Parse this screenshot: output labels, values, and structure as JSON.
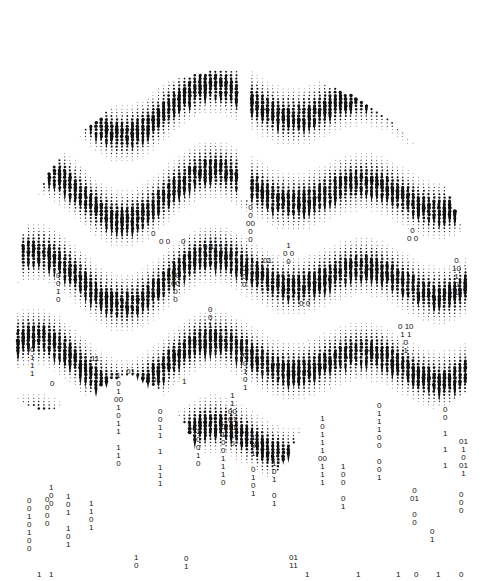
{
  "artwork": {
    "subject": "brain",
    "style": "halftone dot-and-droplet pattern dissolving into binary digits",
    "colors": {
      "ink": "#111111",
      "background": "#ffffff"
    },
    "brain_center": [
      243,
      260
    ],
    "brain_radius": [
      225,
      215
    ]
  },
  "binary_columns": [
    {
      "x": 31,
      "y": 545,
      "text": "0\n0\n1\n0\n1\n0\n0"
    },
    {
      "x": 41,
      "y": 571,
      "text": "1"
    },
    {
      "x": 53,
      "y": 500,
      "text": "1\n0\n0"
    },
    {
      "x": 49,
      "y": 520,
      "text": "0\n0\n0\n0"
    },
    {
      "x": 53,
      "y": 571,
      "text": "1"
    },
    {
      "x": 70,
      "y": 541,
      "text": "1\n0\n1\n\n1\n0\n1"
    },
    {
      "x": 93,
      "y": 524,
      "text": "1\n1\n0\n1"
    },
    {
      "x": 118,
      "y": 460,
      "text": "1\n0\n1\n00\n1\n0\n1\n1\n\n1\n1\n0"
    },
    {
      "x": 138,
      "y": 562,
      "text": "1\n0"
    },
    {
      "x": 162,
      "y": 480,
      "text": "0\n0\n1\n1\n\n1\n\n1\n1\n1"
    },
    {
      "x": 188,
      "y": 563,
      "text": "0\n1"
    },
    {
      "x": 200,
      "y": 460,
      "text": "1\n0\n0\n1\n0"
    },
    {
      "x": 225,
      "y": 479,
      "text": "0\n1\n0\n0\n1\n1\n1\n0"
    },
    {
      "x": 232,
      "y": 440,
      "text": "1\n1\n00\n01\n11\n1\n0"
    },
    {
      "x": 255,
      "y": 490,
      "text": "1\n0\n1\n\n0\n1\n0\n1"
    },
    {
      "x": 276,
      "y": 500,
      "text": "1\n0\n1\n\n0\n1"
    },
    {
      "x": 322,
      "y": 479,
      "text": "1\n0\n1\n1\n1\n00\n1\n1\n1"
    },
    {
      "x": 345,
      "y": 503,
      "text": "1\n0\n0\n\n0\n1"
    },
    {
      "x": 381,
      "y": 474,
      "text": "0\n1\n1\n1\n0\n0\n\n0\n0\n1"
    },
    {
      "x": 414,
      "y": 519,
      "text": "0\n01\n\n0\n0"
    },
    {
      "x": 447,
      "y": 462,
      "text": "0\n0\n\n1\n\n1\n\n1"
    },
    {
      "x": 463,
      "y": 470,
      "text": "01\n1\n0\n01\n1"
    },
    {
      "x": 463,
      "y": 507,
      "text": "0\n0\n0"
    },
    {
      "x": 434,
      "y": 536,
      "text": "0\n1"
    },
    {
      "x": 440,
      "y": 571,
      "text": "1"
    },
    {
      "x": 463,
      "y": 571,
      "text": "0"
    },
    {
      "x": 293,
      "y": 562,
      "text": "01\n11"
    },
    {
      "x": 309,
      "y": 571,
      "text": "1"
    },
    {
      "x": 360,
      "y": 571,
      "text": "1"
    },
    {
      "x": 400,
      "y": 571,
      "text": "1"
    },
    {
      "x": 418,
      "y": 571,
      "text": "0"
    }
  ],
  "inner_digits": [
    {
      "x": 155,
      "y": 230,
      "text": "0"
    },
    {
      "x": 163,
      "y": 238,
      "text": "0 0"
    },
    {
      "x": 185,
      "y": 238,
      "text": "0"
    },
    {
      "x": 207,
      "y": 243,
      "text": "0 1"
    },
    {
      "x": 250,
      "y": 236,
      "text": "0\n0\n00\n0\n0"
    },
    {
      "x": 267,
      "y": 257,
      "text": "01"
    },
    {
      "x": 287,
      "y": 258,
      "text": "1\n0 0\n0"
    },
    {
      "x": 175,
      "y": 296,
      "text": "10\n00\n0\n0"
    },
    {
      "x": 246,
      "y": 281,
      "text": "0\n0\n0"
    },
    {
      "x": 303,
      "y": 300,
      "text": "0 0"
    },
    {
      "x": 411,
      "y": 235,
      "text": "0\n0 0"
    },
    {
      "x": 456,
      "y": 289,
      "text": "0\n10\n1\n0\n1"
    },
    {
      "x": 402,
      "y": 347,
      "text": "0 10\n1 1\n0\n1"
    },
    {
      "x": 34,
      "y": 370,
      "text": "0\n1\n1\n1"
    },
    {
      "x": 54,
      "y": 380,
      "text": "0"
    },
    {
      "x": 95,
      "y": 355,
      "text": "11"
    },
    {
      "x": 130,
      "y": 368,
      "text": "01"
    },
    {
      "x": 156,
      "y": 376,
      "text": "01"
    },
    {
      "x": 186,
      "y": 378,
      "text": "1"
    },
    {
      "x": 60,
      "y": 296,
      "text": "0\n0\n1\n0"
    },
    {
      "x": 212,
      "y": 330,
      "text": "0\n0\n1\n1"
    },
    {
      "x": 247,
      "y": 384,
      "text": "0\n0\n1\n0\n1"
    }
  ]
}
